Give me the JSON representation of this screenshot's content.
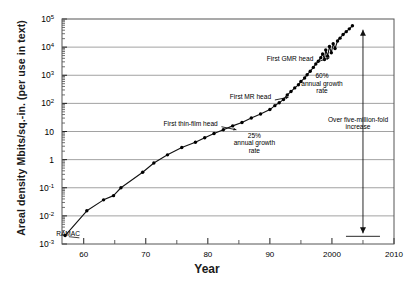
{
  "chart_data": {
    "type": "scatter",
    "title": "",
    "xlabel": "Year",
    "ylabel": "Areal density Mbits/sq.-in. (per use in text)",
    "xlim": [
      1956.5,
      2010
    ],
    "ylim": [
      -3,
      5
    ],
    "yscale": "log",
    "grid": "horizontal major only",
    "legend": "none",
    "ytick_labels": [
      "10-3",
      "10-2",
      "10-1",
      "1",
      "10",
      "102",
      "103",
      "104",
      "105"
    ],
    "ytick_values": [
      -3,
      -2,
      -1,
      0,
      1,
      2,
      3,
      4,
      5
    ],
    "xtick_labels": [
      "60",
      "70",
      "80",
      "90",
      "2000",
      "2010"
    ],
    "xtick_values": [
      1960,
      1970,
      1980,
      1990,
      2000,
      2010
    ],
    "xminor_values": [
      1965,
      1975,
      1985,
      1995,
      2005
    ],
    "series": [
      {
        "name": "Areal density",
        "points": [
          [
            1957,
            -2.7
          ],
          [
            1960.5,
            -1.82
          ],
          [
            1963.2,
            -1.43
          ],
          [
            1964.8,
            -1.28
          ],
          [
            1966.0,
            -1.0
          ],
          [
            1969.5,
            -0.45
          ],
          [
            1971.3,
            -0.12
          ],
          [
            1973.5,
            0.17
          ],
          [
            1975.8,
            0.43
          ],
          [
            1978.0,
            0.62
          ],
          [
            1979.5,
            0.78
          ],
          [
            1981.0,
            0.93
          ],
          [
            1982.5,
            1.06
          ],
          [
            1984.0,
            1.2
          ],
          [
            1985.5,
            1.32
          ],
          [
            1987.0,
            1.48
          ],
          [
            1988.5,
            1.62
          ],
          [
            1990.0,
            1.78
          ],
          [
            1990.8,
            1.92
          ],
          [
            1991.5,
            2.02
          ],
          [
            1992.2,
            2.14
          ],
          [
            1992.8,
            2.3
          ],
          [
            1993.4,
            2.42
          ],
          [
            1994.0,
            2.55
          ],
          [
            1994.6,
            2.66
          ],
          [
            1995.0,
            2.78
          ],
          [
            1995.6,
            2.9
          ],
          [
            1996.0,
            3.02
          ],
          [
            1996.5,
            3.14
          ],
          [
            1997.0,
            3.28
          ],
          [
            1997.4,
            3.4
          ],
          [
            1997.8,
            3.5
          ],
          [
            1998.2,
            3.62
          ],
          [
            1998.5,
            3.76
          ],
          [
            1998.8,
            3.56
          ],
          [
            1999.0,
            3.9
          ],
          [
            1999.3,
            3.68
          ],
          [
            1999.6,
            4.02
          ],
          [
            1999.9,
            3.8
          ],
          [
            2000.2,
            4.12
          ],
          [
            2000.5,
            3.95
          ],
          [
            2000.9,
            4.22
          ],
          [
            2001.3,
            4.32
          ],
          [
            2001.8,
            4.45
          ],
          [
            2002.3,
            4.55
          ],
          [
            2002.8,
            4.65
          ],
          [
            2003.3,
            4.76
          ]
        ]
      }
    ],
    "annotations": [
      {
        "name": "ramac-label",
        "text": "RAMAC",
        "x": 1959.4,
        "y": -2.72
      },
      {
        "name": "first-thin-film-head",
        "text": "First thin-film head",
        "x": 1981.6,
        "y": 1.2
      },
      {
        "name": "first-mr-head",
        "text": "First MR head",
        "x": 1990.2,
        "y": 2.15
      },
      {
        "name": "first-gmr-head",
        "text": "First GMR head",
        "x": 1997.0,
        "y": 3.5
      },
      {
        "name": "growth-rate-25",
        "lines": [
          "25%",
          "annual growth",
          "rate"
        ],
        "x": 1987.5,
        "y": 0.78
      },
      {
        "name": "growth-rate-60",
        "lines": [
          "60%",
          "annual growth",
          "rate"
        ],
        "x": 1998.4,
        "y": 2.9
      },
      {
        "name": "five-million-fold",
        "lines": [
          "Over five-million-fold",
          "increase"
        ],
        "x": 2004.2,
        "y": 1.35
      }
    ]
  }
}
